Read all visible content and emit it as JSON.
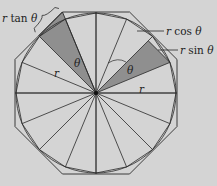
{
  "diagram": {
    "type": "geometry",
    "center": [
      96,
      93
    ],
    "radius": 80,
    "colors": {
      "background": "#d4d4d4",
      "stroke": "#2a2a2a",
      "shade": "#8f8f8f"
    },
    "labels": {
      "r_tan": "r tan θ",
      "r_cos": "r cos θ",
      "r_sin": "r sin θ",
      "theta_left": "θ",
      "theta_right": "θ",
      "r_left": "r",
      "r_right": "r"
    }
  }
}
